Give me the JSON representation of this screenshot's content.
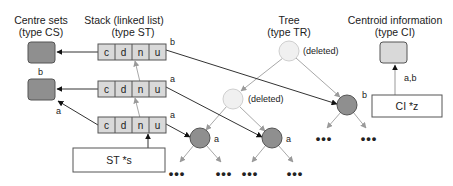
{
  "titles": {
    "centre_sets": [
      "Centre sets",
      "(type CS)"
    ],
    "stack": [
      "Stack (linked list)",
      "(type ST)"
    ],
    "tree": [
      "Tree",
      "(type TR)"
    ],
    "centroid": [
      "Centroid information",
      "(type CI)"
    ]
  },
  "stack": {
    "cells": [
      "c",
      "d",
      "n",
      "u"
    ],
    "rows": [
      {
        "label": "b"
      },
      {
        "label": "a"
      },
      {
        "label": "a"
      }
    ],
    "pointer_label": "ST *s"
  },
  "centre_sets": {
    "labels": [
      "b",
      "a"
    ]
  },
  "tree": {
    "deleted_label": "(deleted)",
    "node_labels": {
      "right": "b",
      "left": "a",
      "middle": "a"
    },
    "ellipsis": "•••"
  },
  "centroid": {
    "arrow_label": "a,b",
    "pointer_label": "CI *z"
  },
  "colors": {
    "dark_fill": "#8f8f8f",
    "light_fill": "#d9d9d9",
    "deleted_fill": "#f0f0f0",
    "line_dark": "#333333",
    "line_light": "#a8a8a8"
  }
}
